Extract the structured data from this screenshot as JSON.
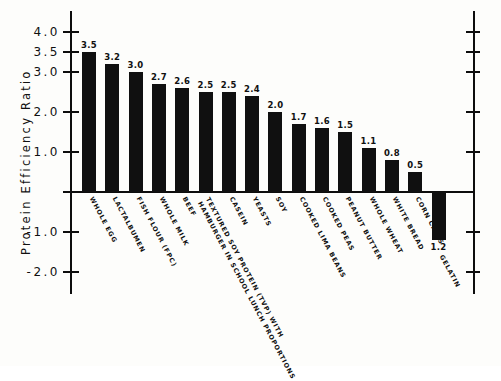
{
  "chart_data": {
    "type": "bar",
    "title": "",
    "xlabel": "",
    "ylabel": "Protein Efficiency Ratio",
    "ylim": [
      -2.0,
      4.0
    ],
    "grid": false,
    "legend": "none",
    "ytick_labels": [
      "4.0",
      "3.5",
      "3.0",
      "2.0",
      "1.0",
      "-1.0",
      "-2.0"
    ],
    "ytick_values": [
      4.0,
      3.5,
      3.0,
      2.0,
      1.0,
      -1.0,
      -2.0
    ],
    "categories": [
      "WHOLE EGG",
      "LACTALBUMEN",
      "FISH FLOUR (FPC)",
      "WHOLE MILK",
      "BEEF",
      "TEXTURED SOY PROTEIN (TVP) WITH\nHAMBURGER IN SCHOOL LUNCH PROPORTIONS",
      "CASEIN",
      "YEASTS",
      "SOY",
      "COOKED LIMA BEANS",
      "COOKED PEAS",
      "PEANUT BUTTER",
      "WHOLE WHEAT",
      "WHITE BREAD",
      "CORN CHIPS",
      "GELATIN"
    ],
    "values": [
      3.5,
      3.2,
      3.0,
      2.7,
      2.6,
      2.5,
      2.5,
      2.4,
      2.0,
      1.7,
      1.6,
      1.5,
      1.1,
      0.8,
      0.5,
      -1.2
    ],
    "value_labels": [
      "3.5",
      "3.2",
      "3.0",
      "2.7",
      "2.6",
      "2.5",
      "2.5",
      "2.4",
      "2.0",
      "1.7",
      "1.6",
      "1.5",
      "1.1",
      "0.8",
      "0.5",
      "1.2"
    ],
    "bar_color": "#101010"
  }
}
